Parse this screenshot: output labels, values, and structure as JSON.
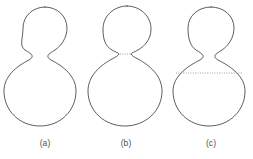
{
  "figure": {
    "background_color": "#ffffff",
    "outline_color": "#4a4a4a",
    "dotted_color": "#8d8d8d",
    "panels": [
      {
        "id": "a",
        "label": "(a)",
        "description": "Peanut-shaped vesicle with a smooth open neck connecting the small upper bulb and large lower bulb; no dotted line.",
        "neck_state": "open",
        "dotted_line": "none",
        "upper_bulb": {
          "center_x": 45,
          "center_y": 29,
          "radius_x": 22,
          "radius_y": 22
        },
        "lower_bulb": {
          "center_x": 40,
          "center_y": 91,
          "radius_x": 36,
          "radius_y": 35
        },
        "neck_y": 55,
        "neck_half_width": 10,
        "label_x": 45,
        "label_y": 146
      },
      {
        "id": "b",
        "label": "(b)",
        "description": "Vesicle pinched at the neck to a narrow waist, with a short dotted line marking the closing neck.",
        "neck_state": "pinched",
        "dotted_line": "short-neck",
        "upper_bulb": {
          "center_x": 127,
          "center_y": 28,
          "radius_x": 24,
          "radius_y": 23
        },
        "lower_bulb": {
          "center_x": 125,
          "center_y": 91,
          "radius_x": 37,
          "radius_y": 35
        },
        "neck_y": 54,
        "neck_half_width": 5,
        "dotted_line_x1": 120,
        "dotted_line_x2": 131,
        "dotted_line_y": 54,
        "label_x": 126,
        "label_y": 146
      },
      {
        "id": "c",
        "label": "(c)",
        "description": "Vesicle with a narrow neck and a long dotted chord across the equator of the large lower bulb.",
        "neck_state": "open",
        "dotted_line": "long-equator",
        "upper_bulb": {
          "center_x": 211,
          "center_y": 29,
          "radius_x": 23,
          "radius_y": 22
        },
        "lower_bulb": {
          "center_x": 209,
          "center_y": 91,
          "radius_x": 36,
          "radius_y": 35
        },
        "neck_y": 55,
        "neck_half_width": 10,
        "dotted_line_x1": 176,
        "dotted_line_x2": 242,
        "dotted_line_y": 73,
        "label_x": 211,
        "label_y": 146
      }
    ]
  }
}
